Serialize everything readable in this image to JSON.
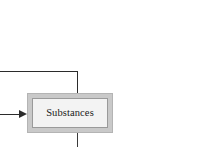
{
  "diagram": {
    "type": "flowchart-fragment",
    "background_color": "#ffffff",
    "nodes": [
      {
        "id": "substances",
        "label": "Substances",
        "shape": "rectangle-double-border",
        "fill_color": "#f3f3f3",
        "band_color": "#c9c9c9",
        "border_color": "#9a9a9a",
        "text_color": "#1a1a1a"
      }
    ],
    "edges": [
      {
        "id": "edge-top",
        "style": "elbow",
        "direction": "into-node-top",
        "arrowhead": false,
        "color": "#2b2b2b"
      },
      {
        "id": "edge-in",
        "style": "straight",
        "direction": "into-node-left",
        "arrowhead": true,
        "color": "#2b2b2b"
      },
      {
        "id": "edge-out",
        "style": "straight",
        "direction": "out-of-node-bottom",
        "arrowhead": false,
        "color": "#3a3a3a"
      }
    ]
  }
}
